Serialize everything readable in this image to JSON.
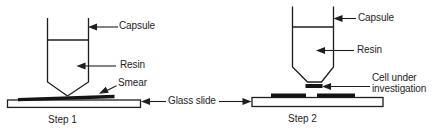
{
  "figure": {
    "background_color": "#ffffff",
    "ink_color": "#1e1e1e",
    "step1": {
      "caption": "Step 1",
      "capsule_label": "Capsule",
      "resin_label": "Resin",
      "smear_label": "Smear"
    },
    "step2": {
      "caption": "Step 2",
      "capsule_label": "Capsule",
      "resin_label": "Resin",
      "cell_label": "Cell under investigation"
    },
    "glass_slide_label": "Glass slide"
  }
}
